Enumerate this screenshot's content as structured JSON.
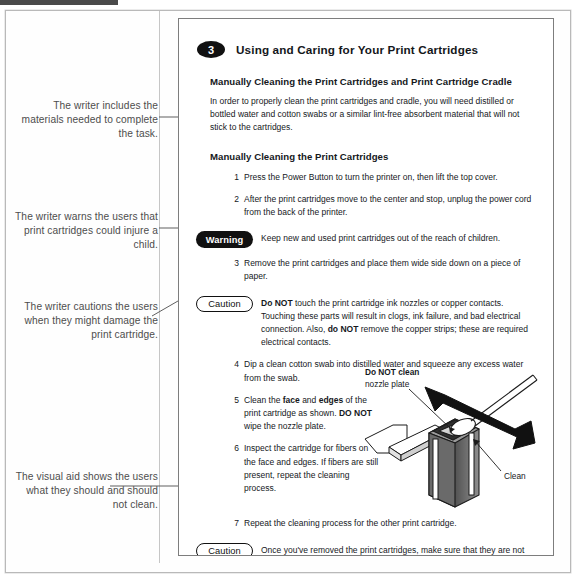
{
  "document": {
    "chapter_number": "3",
    "chapter_title": "Using and Caring for Your Print Cartridges",
    "section_heading_1": "Manually Cleaning the Print Cartridges and Print Cartridge Cradle",
    "intro_paragraph": "In order to properly clean the print cartridges and cradle, you will need distilled or bottled water and cotton swabs or a similar lint-free absorbent material that will not stick to the cartridges.",
    "section_heading_2": "Manually Cleaning the Print Cartridges",
    "steps": [
      {
        "num": "1",
        "text": "Press the Power Button to turn the printer on, then lift the top cover."
      },
      {
        "num": "2",
        "text": "After the print cartridges move to the center and stop, unplug the power cord from the back of the printer."
      },
      {
        "num": "3",
        "text": "Remove the print cartridges and place them wide side down on a piece of paper."
      },
      {
        "num": "4",
        "text": "Dip a clean cotton swab into distilled water and squeeze any excess water from the swab."
      },
      {
        "num": "5",
        "text": "Clean the face and edges of the print cartridge as shown. DO NOT wipe the nozzle plate."
      },
      {
        "num": "6",
        "text": "Inspect the cartridge for fibers on the face and edges. If fibers are still present, repeat the cleaning process."
      },
      {
        "num": "7",
        "text": "Repeat the cleaning process for the other print cartridge."
      }
    ],
    "step5_parts": {
      "a": "Clean the ",
      "b1": "face",
      "c": " and ",
      "b2": "edges",
      "d": " of the print cartridge as shown. ",
      "b3": "DO NOT",
      "e": " wipe the nozzle plate."
    },
    "callouts": [
      {
        "label": "Warning",
        "style": "filled",
        "text": "Keep new and used print cartridges out of the reach of children."
      },
      {
        "label": "Caution",
        "style": "outlined",
        "lead_bold": "Do NOT",
        "text_1": " touch the print cartridge ink nozzles or copper contacts. Touching these parts will result in clogs, ink failure, and bad electrical connection. Also, ",
        "lead_bold_2": "do NOT",
        "text_2": " remove the copper strips; these are required electrical contacts."
      },
      {
        "label": "Caution",
        "style": "outlined",
        "text": "Once you've removed the print cartridges, make sure that they are not outside of the printer longer than 30 minutes."
      }
    ],
    "illustration": {
      "label_do_not_clean": "Do NOT clean",
      "label_nozzle_plate": "nozzle plate",
      "label_clean": "Clean"
    }
  },
  "annotations": [
    {
      "id": "materials",
      "text": "The writer includes the materials needed to complete the task."
    },
    {
      "id": "warning",
      "text": "The writer warns the users that print cartridges could injure a child."
    },
    {
      "id": "caution",
      "text": "The writer cautions the users when they might damage the print cartridge."
    },
    {
      "id": "visual-aid",
      "text": "The visual aid shows the users what they should and should not clean."
    }
  ],
  "colors": {
    "ink": "#15181c",
    "annotation_text": "#4d4d4d",
    "badge_fill": "#111111",
    "frame": "#b9b9b9",
    "panel_border": "#7d7d7d",
    "leader_line": "#5f5f5f"
  }
}
